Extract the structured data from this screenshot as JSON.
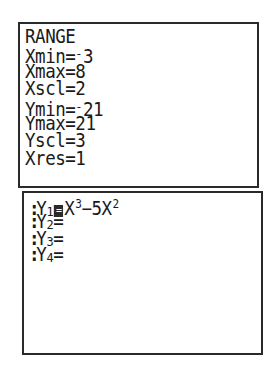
{
  "range_screen": {
    "title": "RANGE",
    "rows": [
      {
        "name": "Xmin",
        "eq": "=",
        "neg": "-",
        "value": "3"
      },
      {
        "name": "Xmax",
        "eq": "=",
        "neg": "",
        "value": "8"
      },
      {
        "name": "Xscl",
        "eq": "=",
        "neg": "",
        "value": "2"
      },
      {
        "name": "Ymin",
        "eq": "=",
        "neg": "-",
        "value": "21"
      },
      {
        "name": "Ymax",
        "eq": "=",
        "neg": "",
        "value": "21"
      },
      {
        "name": "Yscl",
        "eq": "=",
        "neg": "",
        "value": "3"
      },
      {
        "name": "Xres",
        "eq": "=",
        "neg": "",
        "value": "1"
      }
    ]
  },
  "y_screen": {
    "functions": [
      {
        "marker": ":",
        "var": "Y",
        "index": "1",
        "selected": true,
        "eq": "=",
        "expr_parts": {
          "a": "X",
          "a_exp": "3",
          "op": "−5X",
          "b_exp": "2"
        }
      },
      {
        "marker": ":",
        "var": "Y",
        "index": "2",
        "selected": false,
        "eq": "=",
        "expr": ""
      },
      {
        "marker": ":",
        "var": "Y",
        "index": "3",
        "selected": false,
        "eq": "=",
        "expr": ""
      },
      {
        "marker": ":",
        "var": "Y",
        "index": "4",
        "selected": false,
        "eq": "=",
        "expr": ""
      }
    ]
  }
}
